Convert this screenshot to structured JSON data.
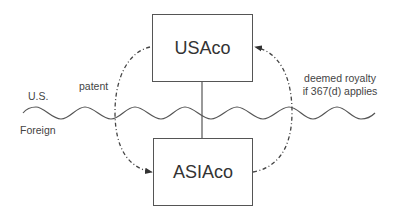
{
  "diagram": {
    "entities": {
      "usaco": {
        "label": "USAco"
      },
      "asiaco": {
        "label": "ASIAco"
      }
    },
    "regions": {
      "upper": "U.S.",
      "lower": "Foreign"
    },
    "flows": {
      "left_arrow": {
        "label": "patent",
        "from": "USAco",
        "to": "ASIAco",
        "style": "dash-dot"
      },
      "right_arrow": {
        "label_line1": "deemed royalty",
        "label_line2": "if 367(d) applies",
        "from": "ASIAco",
        "to": "USAco",
        "style": "dash-dot"
      }
    },
    "connector": {
      "from": "USAco",
      "to": "ASIAco",
      "style": "solid"
    },
    "border": {
      "type": "wavy-line",
      "meaning": "U.S./Foreign boundary"
    },
    "colors": {
      "line": "#555555",
      "text": "#333333",
      "background": "#ffffff"
    }
  }
}
